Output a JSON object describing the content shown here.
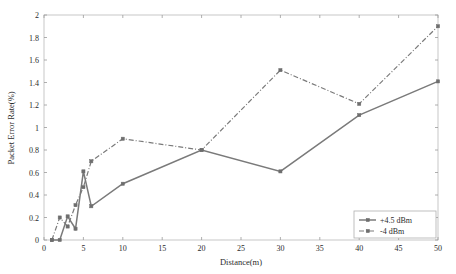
{
  "chart_data": {
    "type": "line",
    "title": "",
    "xlabel": "Distance(m)",
    "ylabel": "Packet Error Rate(%)",
    "xlim": [
      0,
      50
    ],
    "ylim": [
      0,
      2
    ],
    "grid": false,
    "legend_position": "lower-right",
    "xticks": [
      "0",
      "5",
      "10",
      "15",
      "20",
      "25",
      "30",
      "35",
      "40",
      "45",
      "50"
    ],
    "xtick_values": [
      0,
      5,
      10,
      15,
      20,
      25,
      30,
      35,
      40,
      45,
      50
    ],
    "yticks": [
      "0",
      "0.2",
      "0.4",
      "0.6",
      "0.8",
      "1",
      "1.2",
      "1.4",
      "1.6",
      "1.8",
      "2"
    ],
    "ytick_values": [
      0,
      0.2,
      0.4,
      0.6,
      0.8,
      1,
      1.2,
      1.4,
      1.6,
      1.8,
      2
    ],
    "series": [
      {
        "name": "+4.5 dBm",
        "style": "solid",
        "marker": "square",
        "color": "#7a7a7a",
        "x": [
          1,
          2,
          3,
          4,
          5,
          6,
          10,
          20,
          30,
          40,
          50
        ],
        "values": [
          0,
          0,
          0.21,
          0.1,
          0.61,
          0.3,
          0.5,
          0.8,
          0.61,
          1.11,
          1.41
        ]
      },
      {
        "name": "-4 dBm",
        "style": "dash-dot",
        "marker": "square",
        "color": "#7a7a7a",
        "x": [
          1,
          2,
          3,
          4,
          5,
          6,
          10,
          20,
          30,
          40,
          50
        ],
        "values": [
          0,
          0.2,
          0.12,
          0.31,
          0.47,
          0.7,
          0.9,
          0.8,
          1.51,
          1.21,
          1.9
        ]
      }
    ]
  },
  "legend": {
    "entries": [
      {
        "label": "+4.5 dBm"
      },
      {
        "label": "-4 dBm"
      }
    ]
  },
  "axes": {
    "x_title": "Distance(m)",
    "y_title": "Packet Error Rate(%)"
  }
}
